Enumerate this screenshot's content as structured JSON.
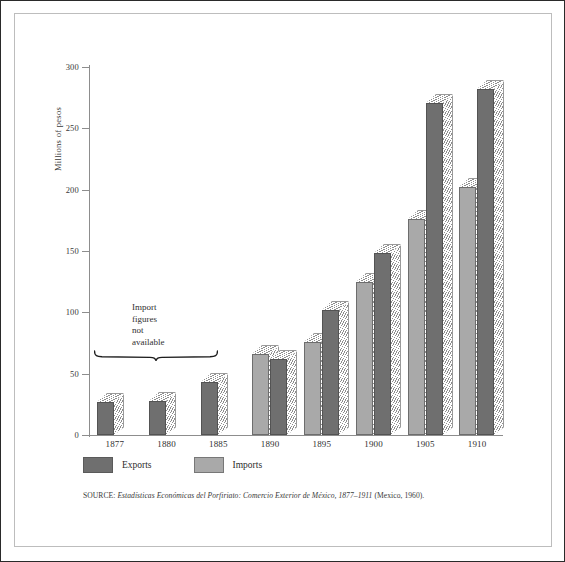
{
  "figure": {
    "y_axis_title": "Millions of pesos",
    "annotation_lines": [
      "Import",
      "figures",
      "not",
      "available"
    ],
    "legend": [
      {
        "key": "exports",
        "label": "Exports",
        "color": "#6f6f6f"
      },
      {
        "key": "imports",
        "label": "Imports",
        "color": "#a9a9a9"
      }
    ],
    "source": {
      "label": "SOURCE:",
      "italic_title": "Estadísticas Económicas del Porfiriato: Comercio Exterior de México, 1877–1911",
      "tail": "(Mexico, 1960)."
    }
  },
  "chart_data": {
    "type": "bar",
    "title": "",
    "xlabel": "",
    "ylabel": "Millions of pesos",
    "ylim": [
      0,
      300
    ],
    "yticks": [
      0,
      50,
      100,
      150,
      200,
      250,
      300
    ],
    "grid": false,
    "legend_position": "bottom-left",
    "categories": [
      "1877",
      "1880",
      "1885",
      "1890",
      "1895",
      "1900",
      "1905",
      "1910"
    ],
    "series": [
      {
        "name": "Imports",
        "color": "#a9a9a9",
        "values": [
          null,
          null,
          null,
          66,
          76,
          125,
          176,
          202
        ]
      },
      {
        "name": "Exports",
        "color": "#6f6f6f",
        "values": [
          27,
          28,
          43,
          62,
          102,
          148,
          271,
          282
        ]
      }
    ],
    "annotations": [
      {
        "text": "Import figures not available",
        "covers": [
          "1877",
          "1880",
          "1885"
        ]
      }
    ]
  }
}
